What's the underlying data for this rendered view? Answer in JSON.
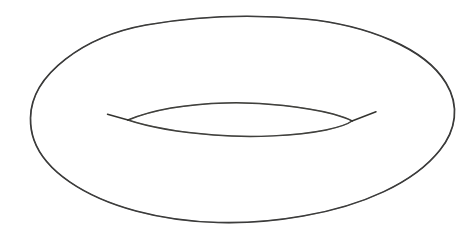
{
  "figure": {
    "title": "Torus",
    "style": "hand-drawn line drawing",
    "background_color": "#ffffff",
    "stroke_color": "#2b2b2b",
    "stroke_width": 1.65,
    "canvas": {
      "width": 475,
      "height": 239
    }
  },
  "shapes": {
    "outer_boundary": {
      "name": "outer-ellipse",
      "type": "ellipse",
      "center_x": 241,
      "center_y": 120,
      "radius_x": 211,
      "radius_y": 104,
      "leftmost_point": [
        30,
        118
      ],
      "rightmost_point": [
        452,
        115
      ],
      "topmost_point": [
        240,
        17
      ],
      "bottommost_point": [
        243,
        224
      ],
      "path": "M 30.5 118 C 31 74 85 36 146 25 C 197 16 252 14 305 19 C 367 25 425 48 446 83 C 460 106 456 130 440 150 C 414 183 362 206 303 216 C 247 226 188 225 136 211 C 84 197 45 171 34 140 C 31.5 133 30.4 125 30.5 118 Z"
    },
    "inner_hole": {
      "name": "inner-lens",
      "type": "lens",
      "left_tip": [
        128,
        120
      ],
      "right_tip": [
        352,
        121
      ],
      "upper_arc_apex": [
        242,
        103
      ],
      "lower_arc_nadir": [
        242,
        136
      ],
      "upper_path": "M 128 120 C 152 110 188 104 226 103 C 264 102 306 107 333 114 C 342 116.5 348 118.5 352 121",
      "lower_path": "M 128 120 C 146 126 176 132 214 135 C 252 138 296 136 326 130 C 340 127 348 124 352 121"
    },
    "tails": [
      {
        "name": "left-overshoot-tail",
        "from": [
          128,
          120
        ],
        "to": [
          107,
          114
        ],
        "path": "M 128 120 L 107.5 114.2"
      },
      {
        "name": "right-overshoot-tail",
        "from": [
          352,
          121
        ],
        "to": [
          376,
          112
        ],
        "path": "M 352 121 L 376 111.8"
      }
    ]
  }
}
